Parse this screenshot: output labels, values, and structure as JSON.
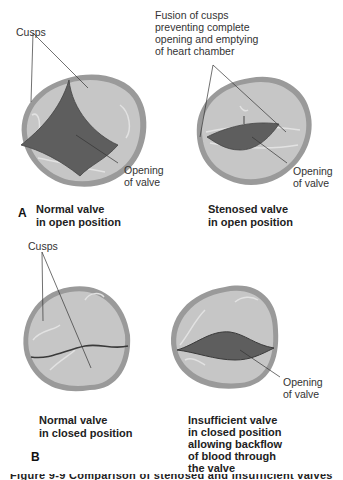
{
  "figure": {
    "panel_a": {
      "letter": "A",
      "normal": {
        "label_cusps": "Cusps",
        "label_opening_line1": "Opening",
        "label_opening_line2": "of valve",
        "caption_line1": "Normal valve",
        "caption_line2": "in open position"
      },
      "stenosed": {
        "label_fusion_line1": "Fusion of cusps",
        "label_fusion_line2": "preventing complete",
        "label_fusion_line3": "opening and emptying",
        "label_fusion_line4": "of heart chamber",
        "label_opening_line1": "Opening",
        "label_opening_line2": "of valve",
        "caption_line1": "Stenosed valve",
        "caption_line2": "in open position"
      }
    },
    "panel_b": {
      "letter": "B",
      "normal": {
        "label_cusps": "Cusps",
        "caption_line1": "Normal valve",
        "caption_line2": "in closed position"
      },
      "insufficient": {
        "label_opening_line1": "Opening",
        "label_opening_line2": "of valve",
        "caption_line1": "Insufficient valve",
        "caption_line2": "in closed position",
        "caption_line3": "allowing backflow",
        "caption_line4": "of blood through",
        "caption_line5": "the valve"
      }
    },
    "cutoff_caption": "Figure 9-9 Comparison of stenosed and insufficient valves",
    "colors": {
      "valve_rim": "#9a9a9a",
      "valve_fill": "#c4c4c4",
      "opening": "#5e5e5e",
      "leader_line": "#333333"
    }
  }
}
